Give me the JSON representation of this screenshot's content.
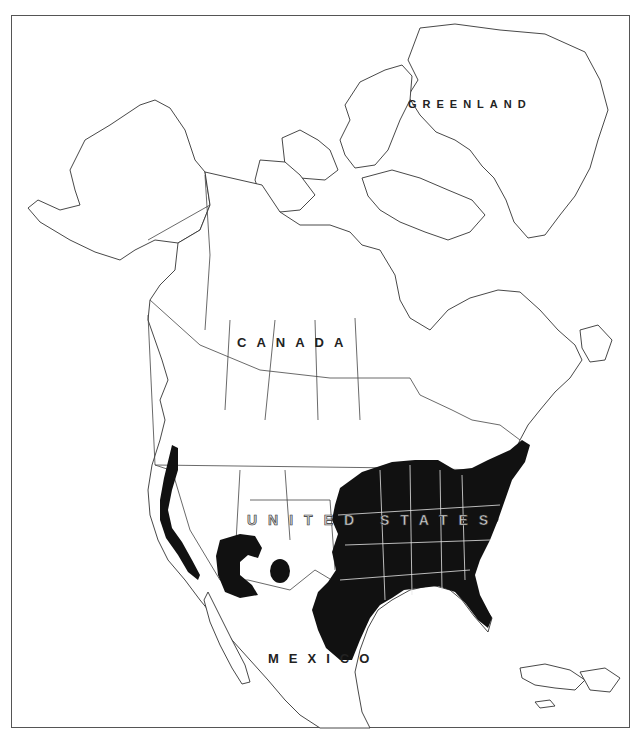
{
  "map": {
    "type": "species range map",
    "region": "North America",
    "colors": {
      "background": "#ffffff",
      "frame": "#555555",
      "outline": "#333333",
      "range_fill": "#111111",
      "range_inner_borders": "#e6e6e6"
    },
    "labels": {
      "greenland": "GREENLAND",
      "canada": "CANADA",
      "united_states": "UNITED STATES",
      "mexico": "MEXICO"
    },
    "range_areas": [
      "Eastern United States (Great Plains east to Atlantic coast, Texas to New England)",
      "California Central Valley / Sierra foothills",
      "Arizona (central highlands)",
      "New Mexico (isolated patch)"
    ]
  }
}
